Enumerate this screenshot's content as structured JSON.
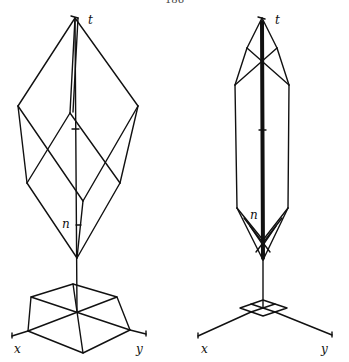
{
  "page": {
    "number": "186"
  },
  "figures": [
    {
      "id": "left",
      "description": "Wireframe double-pyramid (rhombic) solid above a hexagonal base on xy plane, with vertical t axis",
      "labels": {
        "apex": "t",
        "marker": "n",
        "x_axis": "x",
        "y_axis": "y"
      }
    },
    {
      "id": "right",
      "description": "Elongated wireframe solid with thick central axis above small square base on xy plane",
      "labels": {
        "apex": "t",
        "marker": "n",
        "x_axis": "x",
        "y_axis": "y"
      }
    }
  ],
  "style": {
    "stroke": "#111111",
    "background": "#ffffff"
  }
}
